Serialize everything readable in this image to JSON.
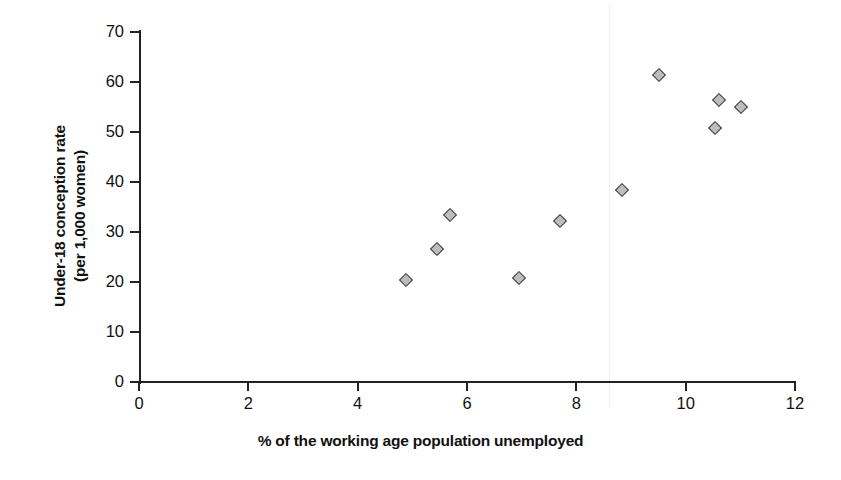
{
  "chart_data": {
    "type": "scatter",
    "title": "",
    "xlabel": "% of the working age population unemployed",
    "ylabel_line1": "Under-18 conception rate",
    "ylabel_line2": "(per 1,000 women)",
    "xlim": [
      0,
      12
    ],
    "ylim": [
      0,
      70
    ],
    "xticks": [
      "0",
      "2",
      "4",
      "6",
      "8",
      "10",
      "12"
    ],
    "xtick_values": [
      0,
      2,
      4,
      6,
      8,
      10,
      12
    ],
    "yticks": [
      "0",
      "10",
      "20",
      "30",
      "40",
      "50",
      "60",
      "70"
    ],
    "ytick_values": [
      0,
      10,
      20,
      30,
      40,
      50,
      60,
      70
    ],
    "grid": false,
    "legend": null,
    "marker": {
      "shape": "diamond",
      "fill_color": "#bdbdbd",
      "edge_color": "#3a3a3a"
    },
    "points": [
      {
        "x": 4.88,
        "y": 20.4
      },
      {
        "x": 5.45,
        "y": 26.6
      },
      {
        "x": 5.69,
        "y": 33.4
      },
      {
        "x": 6.95,
        "y": 20.9
      },
      {
        "x": 7.7,
        "y": 32.2
      },
      {
        "x": 8.83,
        "y": 38.4
      },
      {
        "x": 9.52,
        "y": 61.5
      },
      {
        "x": 10.53,
        "y": 50.8
      },
      {
        "x": 10.61,
        "y": 56.4
      },
      {
        "x": 11.02,
        "y": 55.0
      }
    ]
  }
}
